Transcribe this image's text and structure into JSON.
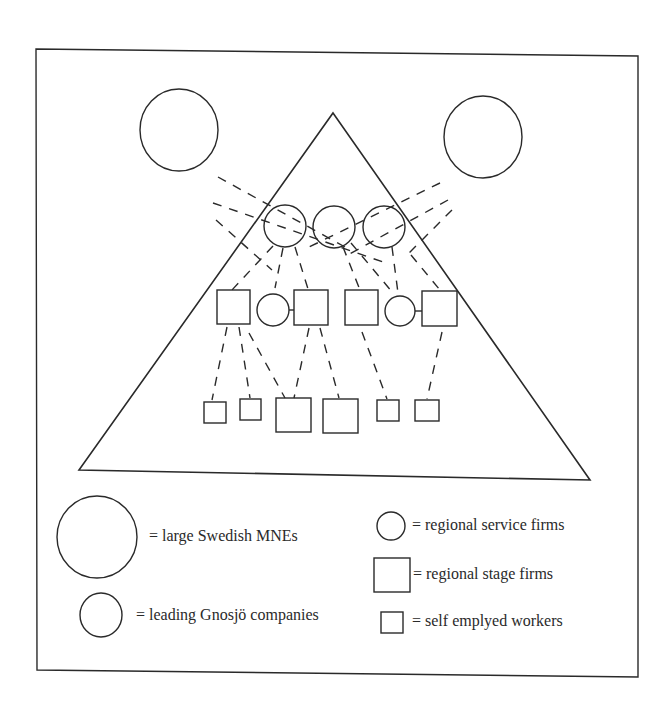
{
  "legend": {
    "large_mne": "= large Swedish MNEs",
    "leading_gnosjo": "= leading Gnosjö companies",
    "regional_service": "= regional service firms",
    "regional_stage": "= regional stage firms",
    "self_employed": "= self emplyed workers"
  },
  "colors": {
    "stroke": "#2a2a2a",
    "background": "#ffffff"
  }
}
